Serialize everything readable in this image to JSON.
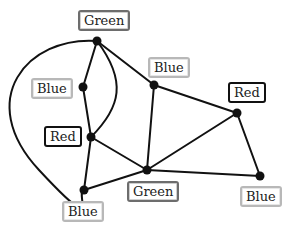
{
  "diagram": {
    "type": "graph-coloring",
    "style": {
      "edge_color": "#111111",
      "node_color": "#111111",
      "label_border": {
        "Red": "#111111",
        "Green": "#6d6d6d",
        "Blue": "#b8b8b8"
      }
    },
    "nodes": [
      {
        "id": "n1",
        "color_label": "Green",
        "x": 97,
        "y": 41,
        "label_x": 78,
        "label_y": 10
      },
      {
        "id": "n2",
        "color_label": "Blue",
        "x": 83,
        "y": 87,
        "label_x": 31,
        "label_y": 78
      },
      {
        "id": "n3",
        "color_label": "Red",
        "x": 91,
        "y": 137,
        "label_x": 44,
        "label_y": 126
      },
      {
        "id": "n4",
        "color_label": "Blue",
        "x": 84,
        "y": 190,
        "label_x": 62,
        "label_y": 201
      },
      {
        "id": "n5",
        "color_label": "Blue",
        "x": 154,
        "y": 85,
        "label_x": 148,
        "label_y": 57
      },
      {
        "id": "n6",
        "color_label": "Green",
        "x": 147,
        "y": 170,
        "label_x": 127,
        "label_y": 181
      },
      {
        "id": "n7",
        "color_label": "Red",
        "x": 237,
        "y": 113,
        "label_x": 228,
        "label_y": 82
      },
      {
        "id": "n8",
        "color_label": "Blue",
        "x": 260,
        "y": 176,
        "label_x": 240,
        "label_y": 186
      }
    ],
    "edges": [
      {
        "from": "n1",
        "to": "n2"
      },
      {
        "from": "n1",
        "to": "n3",
        "curve": "right"
      },
      {
        "from": "n1",
        "to": "n5"
      },
      {
        "from": "n1",
        "to": "n4",
        "curve": "outer-left"
      },
      {
        "from": "n2",
        "to": "n3"
      },
      {
        "from": "n3",
        "to": "n4"
      },
      {
        "from": "n3",
        "to": "n6"
      },
      {
        "from": "n4",
        "to": "n6"
      },
      {
        "from": "n5",
        "to": "n7"
      },
      {
        "from": "n5",
        "to": "n6"
      },
      {
        "from": "n6",
        "to": "n7"
      },
      {
        "from": "n6",
        "to": "n8"
      },
      {
        "from": "n7",
        "to": "n8"
      }
    ]
  },
  "labels": {
    "n1": "Green",
    "n2": "Blue",
    "n3": "Red",
    "n4": "Blue",
    "n5": "Blue",
    "n6": "Green",
    "n7": "Red",
    "n8": "Blue"
  }
}
